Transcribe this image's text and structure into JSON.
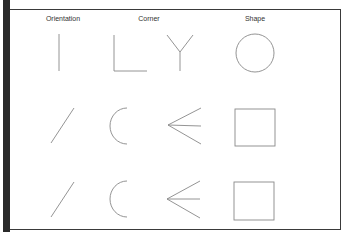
{
  "figure": {
    "columns": [
      {
        "label": "Orientation",
        "x": 63
      },
      {
        "label": "Corner",
        "x": 149
      },
      {
        "label": "Shape",
        "x": 255
      }
    ],
    "rows": [
      {
        "name": "row-1",
        "items": [
          "vertical-line",
          "L-corner",
          "Y-junction",
          "circle"
        ]
      },
      {
        "name": "row-2",
        "items": [
          "diagonal-line",
          "arc-C",
          "arrow-junction",
          "square"
        ]
      },
      {
        "name": "row-3",
        "items": [
          "diagonal-line",
          "arc-C",
          "arrow-junction",
          "square"
        ]
      }
    ],
    "colors": {
      "frame": "#2a2a2a",
      "stroke": "#888888",
      "text": "#333333"
    }
  }
}
